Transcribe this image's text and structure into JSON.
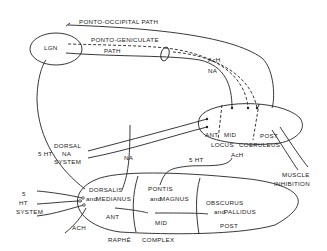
{
  "diagram": {
    "nodes": {
      "lgn": "LGN",
      "locus_coeruleus": {
        "label_a": "LOCUS",
        "label_b": "COERULEUS",
        "ant": "ANT",
        "mid": "MID",
        "post": "POST"
      },
      "raphe_complex": {
        "label_a": "RAPHÉ",
        "label_b": "COMPLEX",
        "ant": "ANT",
        "mid": "MID",
        "post": "POST"
      },
      "dorsalis": "DORSALIS",
      "medianus": "MEDIANUS",
      "pontis": "PONTIS",
      "magnus": "MAGNUS",
      "obscurus": "OBSCURUS",
      "pallidus": "PALLIDUS",
      "and_word": "and"
    },
    "paths": {
      "ponto_occipital": "PONTO-OCCIPITAL PATH",
      "ponto_geniculate_a": "PONTO-GENICULATE",
      "ponto_geniculate_b": "PATH"
    },
    "labels": {
      "ach_top": "AcH",
      "na_top": "NA",
      "dorsal_na_1": "DORSAL",
      "dorsal_na_2": "NA",
      "dorsal_na_3": "SYSTEM",
      "five_ht_left": "5 HT",
      "na_mid": "NA",
      "five_ht_mid": "5 HT",
      "ach_lc": "AcH",
      "muscle_1": "MUSCLE",
      "muscle_2": "INHIBITION",
      "ht_sys_1": "5",
      "ht_sys_2": "HT",
      "ht_sys_3": "SYSTEM",
      "ach_bottom": "ACH"
    }
  }
}
